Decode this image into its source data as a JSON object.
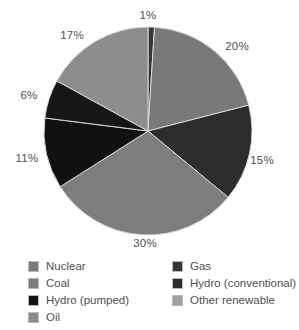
{
  "chart_data": {
    "type": "pie",
    "title": "",
    "subtitle": "",
    "xlabel": "",
    "ylabel": "",
    "grid": false,
    "legend_position": "bottom",
    "units": "percent",
    "start_angle_deg": 0,
    "direction": "clockwise",
    "center": {
      "x": 148,
      "y": 131,
      "radius": 104
    },
    "categories": [
      "Gas",
      "Nuclear",
      "Hydro (conventional)",
      "Coal",
      "Hydro (pumped)",
      "Oil",
      "Other renewable"
    ],
    "values": [
      1,
      20,
      15,
      30,
      11,
      6,
      17
    ],
    "slices": [
      {
        "label": "Gas",
        "value": 1,
        "display": "1%",
        "color": "#353535",
        "label_x": 148,
        "label_y": 15
      },
      {
        "label": "Nuclear",
        "value": 20,
        "display": "20%",
        "color": "#797979",
        "label_x": 237,
        "label_y": 46
      },
      {
        "label": "Hydro (conventional)",
        "value": 15,
        "display": "15%",
        "color": "#2c2c2c",
        "label_x": 262,
        "label_y": 160
      },
      {
        "label": "Coal",
        "value": 30,
        "display": "30%",
        "color": "#7d7d7d",
        "label_x": 145,
        "label_y": 243
      },
      {
        "label": "Hydro (pumped)",
        "value": 11,
        "display": "11%",
        "color": "#111111",
        "label_x": 27,
        "label_y": 158
      },
      {
        "label": "Oil",
        "value": 6,
        "display": "6%",
        "color": "#161616",
        "label_x": 29,
        "label_y": 95
      },
      {
        "label": "Other renewable",
        "value": 17,
        "display": "17%",
        "color": "#8d8d8d",
        "label_x": 72,
        "label_y": 35
      }
    ]
  },
  "legend": {
    "left_column": [
      {
        "label": "Nuclear",
        "color": "#797979"
      },
      {
        "label": "Coal",
        "color": "#7d7d7d"
      },
      {
        "label": "Hydro (pumped)",
        "color": "#111111"
      },
      {
        "label": "Oil",
        "color": "#8a8a8a"
      }
    ],
    "right_column": [
      {
        "label": "Gas",
        "color": "#353535"
      },
      {
        "label": "Hydro (conventional)",
        "color": "#2c2c2c"
      },
      {
        "label": "Other renewable",
        "color": "#a0a0a0"
      }
    ]
  }
}
